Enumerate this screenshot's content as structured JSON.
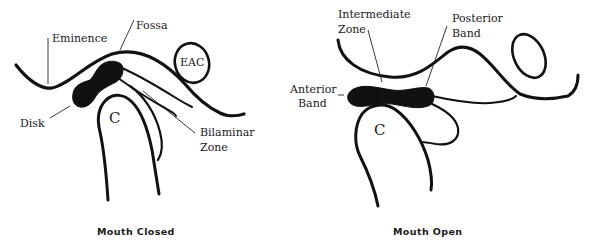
{
  "figure": {
    "panels": [
      {
        "id": "mouth-closed",
        "caption": "Mouth Closed",
        "labels": {
          "eminence": "Eminence",
          "fossa": "Fossa",
          "eac": "EAC",
          "disk": "Disk",
          "condyle": "C",
          "bilaminar_line1": "Bilaminar",
          "bilaminar_line2": "Zone"
        }
      },
      {
        "id": "mouth-open",
        "caption": "Mouth Open",
        "labels": {
          "intermediate_line1": "Intermediate",
          "intermediate_line2": "Zone",
          "posterior_line1": "Posterior",
          "posterior_line2": "Band",
          "anterior_line1": "Anterior",
          "anterior_line2": "Band",
          "condyle": "C"
        }
      }
    ],
    "colors": {
      "ink": "#111111",
      "background": "#ffffff"
    }
  }
}
